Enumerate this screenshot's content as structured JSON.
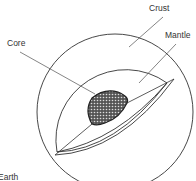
{
  "diagram": {
    "labels": {
      "crust": "Crust",
      "mantle": "Mantle",
      "core": "Core",
      "caption": "Earth"
    },
    "colors": {
      "stroke": "#333333",
      "core_fill": "#777777",
      "background": "#ffffff"
    }
  }
}
